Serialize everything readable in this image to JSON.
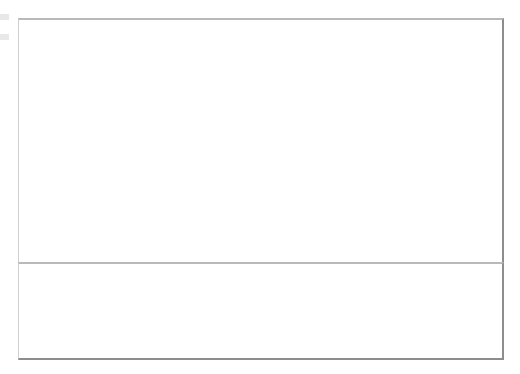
{
  "figure": {
    "left_margin_marks": [
      "mark-upper",
      "mark-lower"
    ]
  },
  "top_chart": {
    "title": "Overall Satisfaction",
    "y_axis_title": "Overall Satisfaction",
    "annotations": [
      {
        "name": "individual-averages",
        "text": "Individual Averages"
      },
      {
        "name": "group-averages",
        "text": "Group Averages"
      }
    ]
  },
  "bottom_chart": {
    "y_axis_title": "Stdev"
  },
  "chart_data": [
    {
      "type": "scatter",
      "name": "overall-satisfaction-individual-averages",
      "title": "Overall Satisfaction",
      "xlabel": "",
      "ylabel": "Overall Satisfaction",
      "ylim": [
        1.394,
        5.394
      ],
      "yticks": [
        1.394,
        1.894,
        2.394,
        2.894,
        3.394,
        3.894,
        4.394,
        4.894,
        5.394
      ],
      "ytick_labels": [
        "1.394",
        "1.894",
        "2.394",
        "2.894",
        "3.394",
        "3.894",
        "4.394",
        "4.894",
        "5.394"
      ],
      "grid": false,
      "legend": "none",
      "annotations": [
        "Individual Averages",
        "Group Averages"
      ],
      "categories": [
        "Large Consumer 1",
        "Large Consumer 2",
        "Large Consumer 3",
        "Large Manufacturer 1",
        "Large Manufacturer 2",
        "Large Manufacturer 3",
        "Small Consumer 1",
        "Small Consumer 2",
        "Small Consumer 3",
        "Small Manufacturer 1",
        "Small Manufacturer 2",
        "Small Manufacturer 3"
      ],
      "series": [
        {
          "name": "Individual Averages",
          "values": [
            3.27,
            4.41,
            3.54,
            3.22,
            4.12,
            3.77,
            3.64,
            4.11,
            3.63,
            3.29,
            4.06,
            3.79
          ],
          "error_low": [
            1.79,
            3.96,
            3.16,
            1.84,
            3.75,
            3.31,
            2.02,
            3.18,
            2.65,
            2.5,
            2.4,
            2.15
          ],
          "error_high": [
            4.81,
            4.92,
            3.73,
            3.95,
            4.72,
            4.15,
            4.73,
            4.55,
            4.25,
            4.04,
            4.77,
            4.83
          ]
        },
        {
          "name": "Group Averages",
          "values": [
            3.894,
            3.894,
            3.894,
            3.74,
            3.74,
            3.74,
            3.66,
            3.66,
            3.66,
            3.83,
            3.83,
            3.83
          ]
        }
      ],
      "groups": [
        {
          "label": "Large Consumer",
          "group_average": 3.894,
          "categories": [
            0,
            1,
            2
          ]
        },
        {
          "label": "Large Manufacturer",
          "group_average": 3.74,
          "categories": [
            3,
            4,
            5
          ]
        },
        {
          "label": "Small Consumer",
          "group_average": 3.66,
          "categories": [
            6,
            7,
            8
          ]
        },
        {
          "label": "Small Manufacturer",
          "group_average": 3.83,
          "categories": [
            9,
            10,
            11
          ]
        }
      ]
    },
    {
      "type": "line",
      "name": "standard-deviation",
      "title": "",
      "xlabel": "",
      "ylabel": "Stdev",
      "ylim": [
        0,
        1.2
      ],
      "yticks": [
        0,
        0.2,
        0.4,
        0.6,
        0.8,
        1.0,
        1.2
      ],
      "ytick_labels": [
        "0",
        "0.2",
        "0.4",
        "0.6",
        "0.8",
        "1",
        "1.2"
      ],
      "grid": false,
      "legend": "none",
      "categories": [
        "Large Consumer 1",
        "Large Consumer 2",
        "Large Consumer 3",
        "Large Manufacturer 1",
        "Large Manufacturer 2",
        "Large Manufacturer 3",
        "Small Consumer 1",
        "Small Consumer 2",
        "Small Consumer 3",
        "Small Manufacturer 1",
        "Small Manufacturer 2",
        "Small Manufacturer 3"
      ],
      "series": [
        {
          "name": "Stdev",
          "values": [
            1.06,
            0.39,
            0.6,
            0.76,
            0.66,
            0.63,
            0.86,
            0.6,
            0.61,
            0.64,
            0.73,
            0.81
          ]
        }
      ],
      "segments": [
        [
          0,
          1,
          2
        ],
        [
          3,
          4,
          5
        ],
        [
          6,
          7,
          8
        ],
        [
          9,
          10,
          11
        ]
      ]
    }
  ]
}
